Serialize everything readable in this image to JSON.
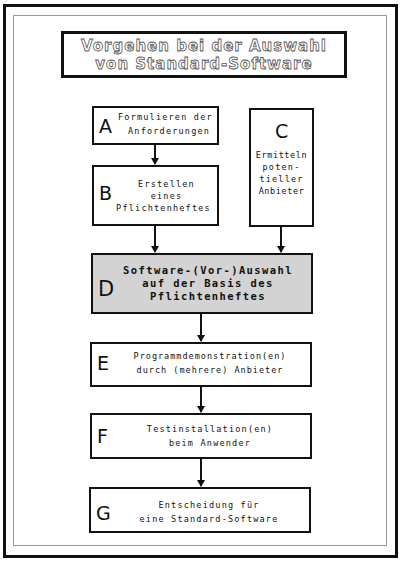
{
  "title": {
    "line1": "Vorgehen bei der Auswahl",
    "line2": "von Standard-Software"
  },
  "steps": [
    {
      "id": "A",
      "lines": [
        "Formulieren der",
        "Anforderungen"
      ]
    },
    {
      "id": "B",
      "lines": [
        "Erstellen",
        "eines",
        "Pflichtenheftes"
      ]
    },
    {
      "id": "C",
      "lines": [
        "Ermitteln",
        "poten-",
        "tieller",
        "Anbieter"
      ]
    },
    {
      "id": "D",
      "lines": [
        "Software-(Vor-)Auswahl",
        "auf der Basis des",
        "Pflichtenheftes"
      ],
      "highlighted": true,
      "fill": "#d3d3d3"
    },
    {
      "id": "E",
      "lines": [
        "Programmdemonstration(en)",
        "durch (mehrere) Anbieter"
      ]
    },
    {
      "id": "F",
      "lines": [
        "Testinstallation(en)",
        "beim Anwender"
      ]
    },
    {
      "id": "G",
      "lines": [
        "Entscheidung für",
        "eine Standard-Software"
      ]
    }
  ],
  "connections": [
    {
      "from": "A",
      "to": "B"
    },
    {
      "from": "B",
      "to": "D"
    },
    {
      "from": "C",
      "to": "D"
    },
    {
      "from": "D",
      "to": "E"
    },
    {
      "from": "E",
      "to": "F"
    },
    {
      "from": "F",
      "to": "G"
    }
  ]
}
